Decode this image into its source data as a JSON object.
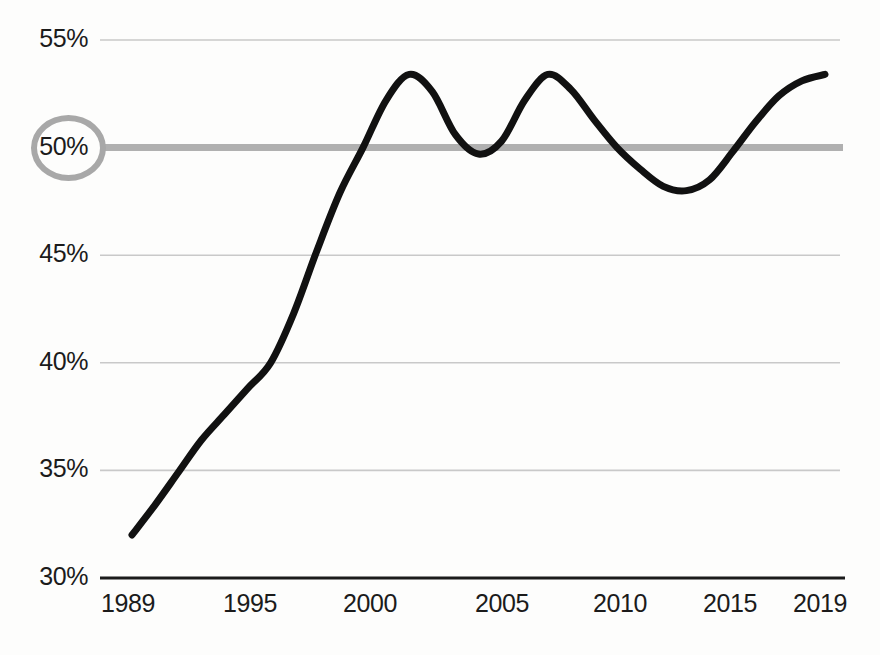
{
  "chart_data": {
    "type": "line",
    "title": "",
    "subtitle": "",
    "xlabel": "",
    "ylabel": "",
    "xlim": [
      1989,
      2019
    ],
    "ylim": [
      30,
      55
    ],
    "grid": true,
    "legend": null,
    "y_ticks": [
      {
        "value": 55,
        "label": "55%",
        "highlighted": false
      },
      {
        "value": 50,
        "label": "50%",
        "highlighted": true
      },
      {
        "value": 45,
        "label": "45%",
        "highlighted": false
      },
      {
        "value": 40,
        "label": "40%",
        "highlighted": false
      },
      {
        "value": 35,
        "label": "35%",
        "highlighted": false
      },
      {
        "value": 30,
        "label": "30%",
        "highlighted": false
      }
    ],
    "x_ticks": [
      {
        "value": 1989,
        "label": "1989"
      },
      {
        "value": 1995,
        "label": "1995"
      },
      {
        "value": 2000,
        "label": "2000"
      },
      {
        "value": 2005,
        "label": "2005"
      },
      {
        "value": 2010,
        "label": "2010"
      },
      {
        "value": 2015,
        "label": "2015"
      },
      {
        "value": 2019,
        "label": "2019"
      }
    ],
    "reference_line": {
      "value": 50,
      "label": "50%",
      "color": "#b0b0b0",
      "width": 7
    },
    "series": [
      {
        "name": "",
        "color": "#111111",
        "width": 7,
        "x": [
          1989,
          1990,
          1991,
          1992,
          1993,
          1994,
          1995,
          1996,
          1997,
          1998,
          1999,
          2000,
          2001,
          2002,
          2003,
          2004,
          2005,
          2006,
          2007,
          2008,
          2009,
          2010,
          2011,
          2012,
          2013,
          2014,
          2015,
          2016,
          2017,
          2018,
          2019
        ],
        "values": [
          32.0,
          33.4,
          34.9,
          36.4,
          37.6,
          38.8,
          40.0,
          42.3,
          45.2,
          47.9,
          50.0,
          52.2,
          53.4,
          52.6,
          50.6,
          49.7,
          50.3,
          52.2,
          53.4,
          52.7,
          51.3,
          50.0,
          49.0,
          48.2,
          48.0,
          48.5,
          49.8,
          51.2,
          52.4,
          53.1,
          53.4
        ]
      }
    ]
  },
  "axis": {
    "baseline_color": "#1b1b1b",
    "gridline_color": "#c9c9c9",
    "text_color": "#1b1b1b"
  },
  "highlight": {
    "ring_color": "#a8a8a8",
    "ring_label": "50%"
  }
}
